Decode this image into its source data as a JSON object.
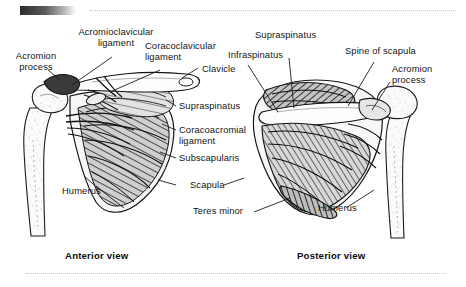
{
  "figure": {
    "kind": "anatomical-illustration",
    "background_color": "#ffffff",
    "ink_color": "#1a1a1a"
  },
  "decor": {
    "gradient_bar": "dark-to-light horizontal gradient bar",
    "top_rule": "dotted horizontal rule",
    "bottom_rule": "dotted horizontal rule"
  },
  "panels": [
    {
      "id": "anterior",
      "caption": "Anterior view"
    },
    {
      "id": "posterior",
      "caption": "Posterior view"
    }
  ],
  "labels": {
    "anterior": [
      {
        "id": "acromion-process",
        "text": "Acromion\nprocess"
      },
      {
        "id": "acromioclavicular-lig",
        "text": "Acromioclavicular\nligament"
      },
      {
        "id": "coracoclavicular-lig",
        "text": "Coracoclavicular\nligament"
      },
      {
        "id": "clavicle",
        "text": "Clavicle"
      },
      {
        "id": "supraspinatus",
        "text": "Supraspinatus"
      },
      {
        "id": "coracoacromial-lig",
        "text": "Coracoacromial\nligament"
      },
      {
        "id": "subscapularis",
        "text": "Subscapularis"
      },
      {
        "id": "scapula",
        "text": "Scapula"
      },
      {
        "id": "humerus",
        "text": "Humerus"
      }
    ],
    "posterior": [
      {
        "id": "supraspinatus",
        "text": "Supraspinatus"
      },
      {
        "id": "infraspinatus",
        "text": "Infraspinatus"
      },
      {
        "id": "spine-of-scapula",
        "text": "Spine of scapula"
      },
      {
        "id": "acromion-process",
        "text": "Acromion\nprocess"
      },
      {
        "id": "teres-minor",
        "text": "Teres minor"
      },
      {
        "id": "humerus",
        "text": "Humerus"
      }
    ]
  }
}
